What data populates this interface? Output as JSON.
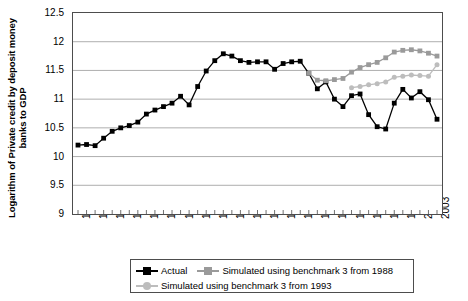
{
  "chart_data": {
    "type": "line",
    "title": "",
    "xlabel": "",
    "ylabel": "Logarithm of Private credit by deposit money banks to GDP",
    "ylim": [
      9,
      12.5
    ],
    "ytick_labels": [
      "12.5",
      "12",
      "11.5",
      "11",
      "10.5",
      "10",
      "9.5",
      "9"
    ],
    "ytick_values": [
      12.5,
      12,
      11.5,
      11,
      10.5,
      10,
      9.5,
      9
    ],
    "grid": true,
    "grid_axis": "y",
    "legend_position": "bottom",
    "xlim": [
      1961,
      2003
    ],
    "x": [
      1961,
      1962,
      1963,
      1964,
      1965,
      1966,
      1967,
      1968,
      1969,
      1970,
      1971,
      1972,
      1973,
      1974,
      1975,
      1976,
      1977,
      1978,
      1979,
      1980,
      1981,
      1982,
      1983,
      1984,
      1985,
      1986,
      1987,
      1988,
      1989,
      1990,
      1991,
      1992,
      1993,
      1994,
      1995,
      1996,
      1997,
      1998,
      1999,
      2000,
      2001,
      2002,
      2003
    ],
    "xtick_labels": [
      "1961",
      "1963",
      "1965",
      "1967",
      "1969",
      "1971",
      "1973",
      "1975",
      "1977",
      "1979",
      "1981",
      "1983",
      "1985",
      "1987",
      "1989",
      "1991",
      "1993",
      "1995",
      "1997",
      "1999",
      "2001",
      "2003"
    ],
    "xtick_values": [
      1961,
      1963,
      1965,
      1967,
      1969,
      1971,
      1973,
      1975,
      1977,
      1979,
      1981,
      1983,
      1985,
      1987,
      1989,
      1991,
      1993,
      1995,
      1997,
      1999,
      2001,
      2003
    ],
    "series": [
      {
        "name": "Actual",
        "color": "#000000",
        "marker": "square",
        "x": [
          1961,
          1962,
          1963,
          1964,
          1965,
          1966,
          1967,
          1968,
          1969,
          1970,
          1971,
          1972,
          1973,
          1974,
          1975,
          1976,
          1977,
          1978,
          1979,
          1980,
          1981,
          1982,
          1983,
          1984,
          1985,
          1986,
          1987,
          1988,
          1989,
          1990,
          1991,
          1992,
          1993,
          1994,
          1995,
          1996,
          1997,
          1998,
          1999,
          2000,
          2001,
          2002,
          2003
        ],
        "values": [
          10.2,
          10.21,
          10.19,
          10.32,
          10.44,
          10.5,
          10.54,
          10.6,
          10.74,
          10.81,
          10.87,
          10.93,
          11.05,
          10.9,
          11.22,
          11.49,
          11.67,
          11.79,
          11.75,
          11.67,
          11.64,
          11.65,
          11.65,
          11.52,
          11.62,
          11.65,
          11.66,
          11.45,
          11.18,
          11.3,
          11.0,
          10.87,
          11.06,
          11.09,
          10.73,
          10.52,
          10.48,
          10.93,
          11.17,
          11.02,
          11.13,
          10.99,
          10.65
        ]
      },
      {
        "name": "Simulated using benchmark 3 from 1988",
        "color": "#9a9a9a",
        "marker": "square",
        "x": [
          1988,
          1989,
          1990,
          1991,
          1992,
          1993,
          1994,
          1995,
          1996,
          1997,
          1998,
          1999,
          2000,
          2001,
          2002,
          2003
        ],
        "values": [
          11.45,
          11.33,
          11.32,
          11.34,
          11.36,
          11.47,
          11.55,
          11.6,
          11.64,
          11.72,
          11.82,
          11.85,
          11.86,
          11.84,
          11.8,
          11.75
        ]
      },
      {
        "name": "Simulated using benchmark 3 from 1993",
        "color": "#bdbdbd",
        "marker": "circle",
        "x": [
          1993,
          1994,
          1995,
          1996,
          1997,
          1998,
          1999,
          2000,
          2001,
          2002,
          2003
        ],
        "values": [
          11.2,
          11.22,
          11.25,
          11.27,
          11.3,
          11.38,
          11.4,
          11.42,
          11.41,
          11.4,
          11.6
        ]
      }
    ]
  },
  "legend": {
    "entries": [
      {
        "label": "Actual"
      },
      {
        "label": "Simulated using benchmark 3 from 1988"
      },
      {
        "label": "Simulated using benchmark 3 from 1993"
      }
    ]
  }
}
